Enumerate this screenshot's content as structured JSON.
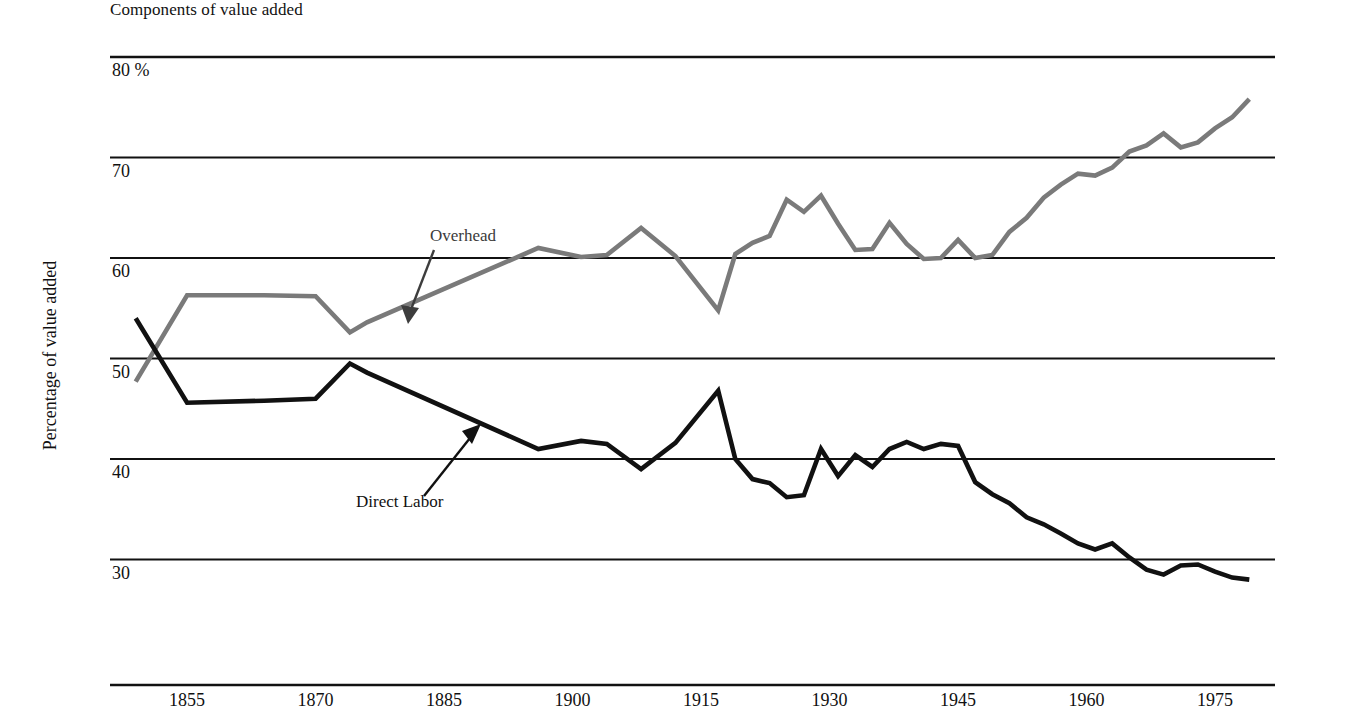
{
  "chart_data": {
    "type": "line",
    "title": "Components of value added",
    "xlabel": "",
    "ylabel": "Percentage of value added",
    "xlim": [
      1846,
      1982
    ],
    "ylim": [
      25,
      80
    ],
    "grid": true,
    "legend_position": "inline-annotations",
    "y_ticks": [
      "80 %",
      "70",
      "60",
      "50",
      "40",
      "30"
    ],
    "y_tick_values": [
      80,
      70,
      60,
      50,
      40,
      30
    ],
    "x_ticks": [
      "1855",
      "1870",
      "1885",
      "1900",
      "1915",
      "1930",
      "1945",
      "1960",
      "1975"
    ],
    "x_tick_values": [
      1855,
      1870,
      1885,
      1900,
      1915,
      1930,
      1945,
      1960,
      1975
    ],
    "annotations": [
      {
        "text": "Overhead",
        "series": "Overhead",
        "color": "#3b3b3b"
      },
      {
        "text": "Direct Labor",
        "series": "Direct Labor",
        "color": "#111111"
      }
    ],
    "series": [
      {
        "name": "Overhead",
        "color": "#7a7a7a",
        "x": [
          1849,
          1855,
          1864,
          1870,
          1874,
          1876,
          1896,
          1901,
          1904,
          1908,
          1912,
          1917,
          1919,
          1921,
          1923,
          1925,
          1927,
          1929,
          1931,
          1933,
          1935,
          1937,
          1939,
          1941,
          1943,
          1945,
          1947,
          1949,
          1951,
          1953,
          1955,
          1957,
          1959,
          1961,
          1963,
          1965,
          1967,
          1969,
          1971,
          1973,
          1975,
          1977,
          1979
        ],
        "y": [
          47.7,
          56.3,
          56.3,
          56.2,
          52.6,
          53.6,
          61.0,
          60.1,
          60.3,
          63.0,
          60.2,
          54.8,
          60.4,
          61.5,
          62.2,
          65.8,
          64.6,
          66.2,
          63.4,
          60.8,
          60.9,
          63.5,
          61.4,
          59.9,
          60.0,
          61.8,
          60.0,
          60.3,
          62.6,
          64.0,
          66.0,
          67.3,
          68.4,
          68.2,
          69.0,
          70.6,
          71.2,
          72.4,
          71.0,
          71.5,
          72.9,
          74.0,
          75.8
        ]
      },
      {
        "name": "Direct Labor",
        "color": "#111111",
        "x": [
          1849,
          1855,
          1864,
          1870,
          1874,
          1876,
          1896,
          1901,
          1904,
          1908,
          1912,
          1917,
          1919,
          1921,
          1923,
          1925,
          1927,
          1929,
          1931,
          1933,
          1935,
          1937,
          1939,
          1941,
          1943,
          1945,
          1947,
          1949,
          1951,
          1953,
          1955,
          1957,
          1959,
          1961,
          1963,
          1965,
          1967,
          1969,
          1971,
          1973,
          1975,
          1977,
          1979
        ],
        "y": [
          54.0,
          45.6,
          45.8,
          46.0,
          49.5,
          48.6,
          41.0,
          41.8,
          41.5,
          39.0,
          41.6,
          46.8,
          40.0,
          38.0,
          37.6,
          36.2,
          36.4,
          41.0,
          38.3,
          40.4,
          39.2,
          41.0,
          41.7,
          41.0,
          41.5,
          41.3,
          37.7,
          36.5,
          35.6,
          34.2,
          33.5,
          32.6,
          31.6,
          31.0,
          31.6,
          30.2,
          29.0,
          28.5,
          29.4,
          29.5,
          28.8,
          28.2,
          28.0
        ]
      }
    ]
  },
  "axes_geometry": {
    "plot_left": 110,
    "plot_right": 1275,
    "x_year_min": 1846,
    "x_year_max": 1982,
    "y_top_value": 80,
    "y_top_px": 57,
    "y_px_per_unit": 10.05,
    "x_axis_line_y": 685
  }
}
